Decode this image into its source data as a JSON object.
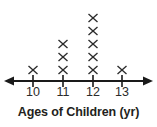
{
  "chart_data": {
    "type": "dot-plot",
    "title": "",
    "xlabel": "Ages of Children (yr)",
    "ylabel": "",
    "categories": [
      "10",
      "11",
      "12",
      "13"
    ],
    "values": [
      1,
      3,
      5,
      1
    ],
    "marker": "x",
    "marker_label": "x-mark",
    "grid": false,
    "legend": false,
    "axis": {
      "left_arrow": true,
      "right_arrow": true,
      "tick_labels": [
        "10",
        "11",
        "12",
        "13"
      ],
      "tick_positions_px": [
        33,
        63,
        93,
        122
      ],
      "line_y_px": 81,
      "line_start_px": 8,
      "line_end_px": 148
    },
    "colors": {
      "marker": "#2b2b2b",
      "axis": "#1a1a1a",
      "label": "#231f20",
      "background": "#ffffff"
    }
  },
  "axis_title": {
    "text": "Ages of Children (yr)"
  },
  "ticks": [
    {
      "label": "10",
      "x": 33,
      "count": 1
    },
    {
      "label": "11",
      "x": 63,
      "count": 3
    },
    {
      "label": "12",
      "x": 93,
      "count": 5
    },
    {
      "label": "13",
      "x": 122,
      "count": 1
    }
  ]
}
